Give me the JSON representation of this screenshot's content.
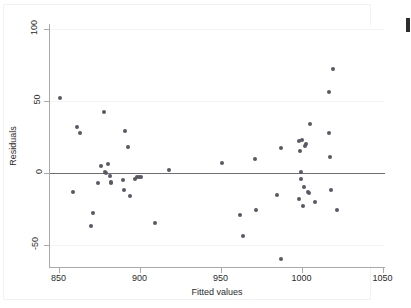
{
  "chart_data": {
    "type": "scatter",
    "title": "",
    "xlabel": "Fitted values",
    "ylabel": "Residuals",
    "xlim": [
      845,
      1055
    ],
    "ylim": [
      -68,
      105
    ],
    "xticks": [
      850,
      900,
      950,
      1000,
      1050
    ],
    "yticks": [
      100,
      50,
      0,
      -50
    ],
    "xtick_labels": [
      "850",
      "900",
      "950",
      "1000",
      "1050"
    ],
    "ytick_labels": [
      "100",
      "50",
      "0",
      "-50"
    ],
    "grid": "horizontal gridlines at y ticks",
    "reference_line": {
      "orientation": "horizontal",
      "y": 0,
      "color": "#6e6e78"
    },
    "legend": "none",
    "marker": {
      "shape": "circle",
      "color": "#595966",
      "size": 4
    },
    "points": [
      {
        "x": 851.5,
        "y": 51
      },
      {
        "x": 859.0,
        "y": -14
      },
      {
        "x": 862.0,
        "y": 31
      },
      {
        "x": 863.5,
        "y": 27
      },
      {
        "x": 870.5,
        "y": -38
      },
      {
        "x": 871.5,
        "y": -29
      },
      {
        "x": 874.5,
        "y": -8
      },
      {
        "x": 876.5,
        "y": 4
      },
      {
        "x": 878.5,
        "y": 41
      },
      {
        "x": 879.0,
        "y": 0
      },
      {
        "x": 879.5,
        "y": -1
      },
      {
        "x": 881.0,
        "y": 5
      },
      {
        "x": 882.0,
        "y": -3
      },
      {
        "x": 882.5,
        "y": -8
      },
      {
        "x": 883.0,
        "y": -7
      },
      {
        "x": 890.0,
        "y": -6
      },
      {
        "x": 891.0,
        "y": -13
      },
      {
        "x": 891.5,
        "y": 28
      },
      {
        "x": 893.5,
        "y": 17
      },
      {
        "x": 894.5,
        "y": -17
      },
      {
        "x": 897.5,
        "y": -5
      },
      {
        "x": 898.5,
        "y": -4
      },
      {
        "x": 900.0,
        "y": -4
      },
      {
        "x": 901.0,
        "y": -4
      },
      {
        "x": 910.0,
        "y": -36
      },
      {
        "x": 918.5,
        "y": 1
      },
      {
        "x": 951.5,
        "y": 6
      },
      {
        "x": 962.5,
        "y": -30
      },
      {
        "x": 964.5,
        "y": -45
      },
      {
        "x": 971.5,
        "y": 9
      },
      {
        "x": 972.5,
        "y": -27
      },
      {
        "x": 985.0,
        "y": -16
      },
      {
        "x": 987.5,
        "y": -61
      },
      {
        "x": 987.5,
        "y": 16
      },
      {
        "x": 998.5,
        "y": -19
      },
      {
        "x": 999.0,
        "y": 21
      },
      {
        "x": 999.5,
        "y": 14
      },
      {
        "x": 1000.0,
        "y": 0
      },
      {
        "x": 1000.0,
        "y": -5
      },
      {
        "x": 1000.5,
        "y": 22
      },
      {
        "x": 1001.0,
        "y": -24
      },
      {
        "x": 1002.0,
        "y": -11
      },
      {
        "x": 1002.5,
        "y": 18
      },
      {
        "x": 1003.0,
        "y": 19
      },
      {
        "x": 1004.5,
        "y": -14
      },
      {
        "x": 1005.0,
        "y": -15
      },
      {
        "x": 1005.5,
        "y": 33
      },
      {
        "x": 1008.5,
        "y": -21
      },
      {
        "x": 1017.5,
        "y": 27
      },
      {
        "x": 1017.5,
        "y": 55
      },
      {
        "x": 1018.0,
        "y": 10
      },
      {
        "x": 1018.5,
        "y": -13
      },
      {
        "x": 1020.0,
        "y": 71
      },
      {
        "x": 1022.5,
        "y": -27
      }
    ]
  },
  "axes": {
    "y_title": "Residuals",
    "x_title": "Fitted values"
  }
}
